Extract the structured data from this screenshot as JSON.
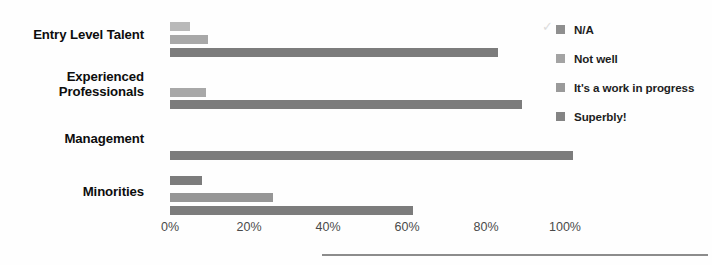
{
  "chart_data": {
    "type": "bar",
    "orientation": "horizontal",
    "title": "",
    "subtitle": "",
    "xlabel": "",
    "ylabel": "",
    "xlim": [
      0,
      110
    ],
    "grid": false,
    "legend_position": "right",
    "categories": [
      "Entry Level Talent",
      "Experienced Professionals",
      "Management",
      "Minorities"
    ],
    "tick_labels": [
      "0%",
      "20%",
      "40%",
      "60%",
      "80%",
      "100%"
    ],
    "tick_values": [
      0,
      20,
      40,
      60,
      80,
      100
    ],
    "series": [
      {
        "name": "N/A",
        "color": "#b9b9b9",
        "values": [
          5,
          null,
          null,
          null
        ]
      },
      {
        "name": "Not well",
        "color": "#a8a8a8",
        "values": [
          9.5,
          9,
          null,
          8
        ]
      },
      {
        "name": "It's a work in progress",
        "color": "#969696",
        "values": [
          null,
          null,
          null,
          26
        ]
      },
      {
        "name": "Superbly!",
        "color": "#7c7c7c",
        "values": [
          83,
          89,
          102,
          61.5
        ]
      }
    ],
    "bars": [
      {
        "category": "Entry Level Talent",
        "series": "N/A",
        "value": 5,
        "shade": "s-na",
        "top": 22
      },
      {
        "category": "Entry Level Talent",
        "series": "Not well",
        "value": 9.5,
        "shade": "s-notwell",
        "top": 35
      },
      {
        "category": "Entry Level Talent",
        "series": "Superbly!",
        "value": 83,
        "shade": "s-superbly",
        "top": 48
      },
      {
        "category": "Experienced Professionals",
        "series": "Not well",
        "value": 9,
        "shade": "s-notwell",
        "top": 88
      },
      {
        "category": "Experienced Professionals",
        "series": "Superbly!",
        "value": 89,
        "shade": "s-superbly",
        "top": 100
      },
      {
        "category": "Management",
        "series": "Superbly!",
        "value": 102,
        "shade": "s-superbly",
        "top": 151
      },
      {
        "category": "Minorities",
        "series": "Not well",
        "value": 8,
        "shade": "s-superbly",
        "top": 176
      },
      {
        "category": "Minorities",
        "series": "It's a work in progress",
        "value": 26,
        "shade": "s-wip",
        "top": 193
      },
      {
        "category": "Minorities",
        "series": "Superbly!",
        "value": 61.5,
        "shade": "s-superbly",
        "top": 206
      }
    ]
  },
  "category_labels": [
    {
      "text": "Entry Level Talent",
      "top": 28
    },
    {
      "text": "Experienced\nProfessionals",
      "top": 70
    },
    {
      "text": "Management",
      "top": 132
    },
    {
      "text": "Minorities",
      "top": 185
    }
  ],
  "legend": {
    "checkmark": "✓",
    "items": [
      {
        "label": "N/A",
        "shade": "s-na"
      },
      {
        "label": "Not well",
        "shade": "s-notwell"
      },
      {
        "label": "It's a work in progress",
        "shade": "s-wip"
      },
      {
        "label": "Superbly!",
        "shade": "s-superbly"
      }
    ]
  }
}
